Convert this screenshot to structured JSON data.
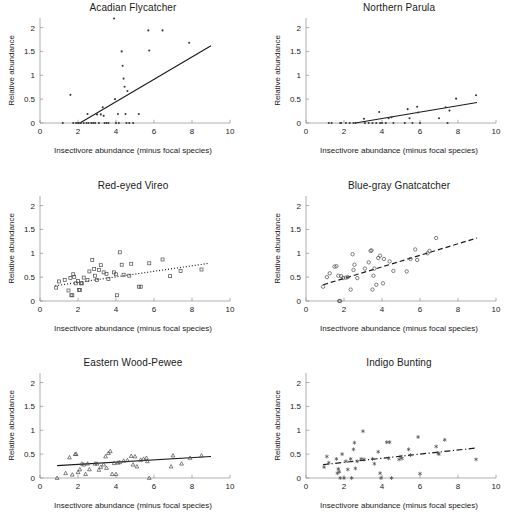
{
  "figure": {
    "width": 532,
    "height": 532,
    "background": "#ffffff",
    "layout": "2 columns x 3 rows of scatter panels",
    "shared_xlabel": "Insectivore abundance (minus focal species)",
    "shared_ylabel": "Relative abundance",
    "xticks": [
      0,
      2,
      4,
      6,
      8,
      10
    ],
    "yticks": [
      0,
      0.5,
      1,
      1.5,
      2
    ],
    "xlim": [
      0,
      10
    ],
    "ylim": [
      0,
      2.2
    ],
    "axis_color": "#8c8c8c",
    "text_color": "#1a1a1a",
    "marker_color": "#3a3a3a",
    "line_color": "#1a1a1a"
  },
  "chart_data": [
    {
      "type": "scatter",
      "title": "Acadian Flycatcher",
      "xlabel": "Insectivore abundance (minus focal species)",
      "ylabel": "Relative abundance",
      "xlim": [
        0,
        10
      ],
      "ylim": [
        0,
        2.2
      ],
      "xticks": [
        0,
        2,
        4,
        6,
        8,
        10
      ],
      "yticks": [
        0,
        0.5,
        1,
        1.5,
        2
      ],
      "grid": false,
      "legend": "none",
      "marker": "point",
      "linestyle": "solid",
      "fit_line": {
        "x": [
          2.1,
          9.0
        ],
        "y": [
          0.0,
          1.62
        ]
      },
      "points": [
        [
          1.2,
          0.0
        ],
        [
          1.6,
          0.59
        ],
        [
          1.75,
          0.0
        ],
        [
          1.9,
          0.0
        ],
        [
          2.0,
          0.0
        ],
        [
          2.05,
          0.0
        ],
        [
          2.15,
          0.0
        ],
        [
          2.3,
          0.0
        ],
        [
          2.45,
          0.0
        ],
        [
          2.5,
          0.19
        ],
        [
          2.55,
          0.0
        ],
        [
          2.7,
          0.0
        ],
        [
          2.8,
          0.0
        ],
        [
          2.9,
          0.0
        ],
        [
          3.0,
          0.18
        ],
        [
          3.1,
          0.0
        ],
        [
          3.2,
          0.18
        ],
        [
          3.3,
          0.33
        ],
        [
          3.35,
          0.15
        ],
        [
          3.4,
          0.0
        ],
        [
          3.5,
          0.0
        ],
        [
          3.6,
          0.0
        ],
        [
          3.9,
          2.19
        ],
        [
          3.95,
          0.5
        ],
        [
          4.0,
          0.0
        ],
        [
          4.1,
          0.19
        ],
        [
          4.15,
          0.0
        ],
        [
          4.3,
          1.5
        ],
        [
          4.35,
          1.2
        ],
        [
          4.4,
          0.93
        ],
        [
          4.45,
          0.76
        ],
        [
          4.5,
          0.19
        ],
        [
          4.55,
          0.0
        ],
        [
          4.6,
          0.67
        ],
        [
          4.7,
          0.0
        ],
        [
          4.9,
          0.0
        ],
        [
          5.2,
          0.19
        ],
        [
          5.7,
          1.94
        ],
        [
          5.75,
          1.52
        ],
        [
          6.45,
          1.94
        ],
        [
          7.85,
          1.68
        ]
      ]
    },
    {
      "type": "scatter",
      "title": "Northern Parula",
      "xlabel": "Insectivore abundance (minus focal species)",
      "ylabel": "Relative abundance",
      "xlim": [
        0,
        10
      ],
      "ylim": [
        0,
        2.2
      ],
      "xticks": [
        0,
        2,
        4,
        6,
        8,
        10
      ],
      "yticks": [
        0,
        0.5,
        1,
        1.5,
        2
      ],
      "grid": false,
      "legend": "none",
      "marker": "point",
      "linestyle": "solid",
      "fit_line": {
        "x": [
          2.6,
          9.0
        ],
        "y": [
          0.0,
          0.43
        ]
      },
      "points": [
        [
          1.2,
          0.0
        ],
        [
          1.35,
          0.0
        ],
        [
          1.8,
          0.0
        ],
        [
          1.85,
          0.0
        ],
        [
          2.1,
          0.0
        ],
        [
          2.3,
          0.0
        ],
        [
          2.5,
          0.0
        ],
        [
          2.6,
          0.0
        ],
        [
          3.05,
          0.09
        ],
        [
          3.1,
          0.0
        ],
        [
          3.3,
          0.0
        ],
        [
          3.5,
          0.0
        ],
        [
          3.7,
          0.0
        ],
        [
          3.85,
          0.23
        ],
        [
          3.9,
          0.0
        ],
        [
          4.0,
          0.0
        ],
        [
          4.2,
          0.0
        ],
        [
          4.35,
          0.1
        ],
        [
          4.5,
          0.12
        ],
        [
          4.6,
          0.0
        ],
        [
          5.2,
          0.0
        ],
        [
          5.35,
          0.29
        ],
        [
          5.45,
          0.1
        ],
        [
          5.6,
          0.0
        ],
        [
          5.85,
          0.34
        ],
        [
          5.9,
          0.22
        ],
        [
          6.0,
          0.0
        ],
        [
          7.0,
          0.1
        ],
        [
          7.35,
          0.33
        ],
        [
          7.45,
          0.0
        ],
        [
          7.55,
          0.26
        ],
        [
          7.9,
          0.51
        ],
        [
          8.95,
          0.58
        ]
      ]
    },
    {
      "type": "scatter",
      "title": "Red-eyed Vireo",
      "xlabel": "Insectivore abundance (minus focal species)",
      "ylabel": "Relative abundance",
      "xlim": [
        0,
        10
      ],
      "ylim": [
        0,
        2.2
      ],
      "xticks": [
        0,
        2,
        4,
        6,
        8,
        10
      ],
      "yticks": [
        0,
        0.5,
        1,
        1.5,
        2
      ],
      "grid": false,
      "legend": "none",
      "marker": "square-open",
      "linestyle": "dotted",
      "fit_line": {
        "x": [
          0.8,
          8.9
        ],
        "y": [
          0.32,
          0.79
        ]
      },
      "points": [
        [
          0.85,
          0.28
        ],
        [
          1.0,
          0.41
        ],
        [
          1.3,
          0.44
        ],
        [
          1.5,
          0.22
        ],
        [
          1.6,
          0.48
        ],
        [
          1.65,
          0.12
        ],
        [
          1.7,
          0.12
        ],
        [
          1.75,
          0.56
        ],
        [
          1.8,
          0.5
        ],
        [
          1.9,
          0.37
        ],
        [
          2.0,
          0.42
        ],
        [
          2.05,
          0.23
        ],
        [
          2.1,
          0.23
        ],
        [
          2.15,
          0.37
        ],
        [
          2.2,
          0.37
        ],
        [
          2.3,
          0.49
        ],
        [
          2.5,
          0.44
        ],
        [
          2.6,
          0.62
        ],
        [
          2.75,
          0.86
        ],
        [
          2.85,
          0.67
        ],
        [
          2.9,
          0.53
        ],
        [
          3.0,
          0.44
        ],
        [
          3.1,
          0.65
        ],
        [
          3.2,
          0.75
        ],
        [
          3.35,
          0.6
        ],
        [
          3.5,
          0.57
        ],
        [
          3.6,
          0.46
        ],
        [
          3.9,
          0.6
        ],
        [
          4.0,
          0.56
        ],
        [
          4.05,
          0.12
        ],
        [
          4.2,
          1.02
        ],
        [
          4.3,
          0.76
        ],
        [
          4.4,
          0.55
        ],
        [
          4.7,
          0.53
        ],
        [
          4.8,
          0.78
        ],
        [
          5.2,
          0.3
        ],
        [
          5.3,
          0.3
        ],
        [
          5.75,
          0.79
        ],
        [
          6.45,
          0.87
        ],
        [
          6.85,
          0.52
        ],
        [
          7.4,
          0.63
        ],
        [
          8.5,
          0.66
        ]
      ]
    },
    {
      "type": "scatter",
      "title": "Blue-gray Gnatcatcher",
      "xlabel": "Insectivore abundance (minus focal species)",
      "ylabel": "Relative abundance",
      "xlim": [
        0,
        10
      ],
      "ylim": [
        0,
        2.2
      ],
      "xticks": [
        0,
        2,
        4,
        6,
        8,
        10
      ],
      "yticks": [
        0,
        0.5,
        1,
        1.5,
        2
      ],
      "grid": false,
      "legend": "none",
      "marker": "circle-open",
      "linestyle": "dashed",
      "fit_line": {
        "x": [
          0.9,
          9.0
        ],
        "y": [
          0.34,
          1.32
        ]
      },
      "points": [
        [
          0.9,
          0.3
        ],
        [
          1.1,
          0.5
        ],
        [
          1.25,
          0.58
        ],
        [
          1.5,
          0.72
        ],
        [
          1.6,
          0.73
        ],
        [
          1.7,
          0.53
        ],
        [
          1.75,
          0.0
        ],
        [
          1.8,
          0.0
        ],
        [
          1.85,
          0.52
        ],
        [
          1.95,
          0.48
        ],
        [
          2.1,
          0.49
        ],
        [
          2.2,
          0.5
        ],
        [
          2.35,
          0.24
        ],
        [
          2.45,
          0.98
        ],
        [
          2.5,
          0.65
        ],
        [
          2.55,
          0.76
        ],
        [
          2.7,
          0.48
        ],
        [
          3.1,
          0.68
        ],
        [
          3.3,
          0.81
        ],
        [
          3.4,
          1.05
        ],
        [
          3.45,
          1.06
        ],
        [
          3.5,
          0.24
        ],
        [
          3.55,
          0.53
        ],
        [
          3.6,
          0.68
        ],
        [
          3.7,
          0.34
        ],
        [
          3.8,
          0.9
        ],
        [
          3.9,
          0.95
        ],
        [
          4.05,
          0.37
        ],
        [
          4.1,
          0.88
        ],
        [
          4.4,
          0.83
        ],
        [
          4.6,
          0.63
        ],
        [
          5.3,
          0.62
        ],
        [
          5.5,
          0.88
        ],
        [
          5.75,
          1.08
        ],
        [
          5.85,
          0.86
        ],
        [
          6.4,
          1.0
        ],
        [
          6.5,
          1.05
        ],
        [
          6.85,
          1.32
        ]
      ]
    },
    {
      "type": "scatter",
      "title": "Eastern Wood-Pewee",
      "xlabel": "Insectivore abundance (minus focal species)",
      "ylabel": "Relative abundance",
      "xlim": [
        0,
        10
      ],
      "ylim": [
        0,
        2.2
      ],
      "xticks": [
        0,
        2,
        4,
        6,
        8,
        10
      ],
      "yticks": [
        0,
        0.5,
        1,
        1.5,
        2
      ],
      "grid": false,
      "legend": "none",
      "marker": "triangle-open",
      "linestyle": "solid",
      "fit_line": {
        "x": [
          0.9,
          9.0
        ],
        "y": [
          0.26,
          0.45
        ]
      },
      "points": [
        [
          0.9,
          0.0
        ],
        [
          1.35,
          0.1
        ],
        [
          1.55,
          0.43
        ],
        [
          1.7,
          0.07
        ],
        [
          1.85,
          0.5
        ],
        [
          1.9,
          0.5
        ],
        [
          2.0,
          0.12
        ],
        [
          2.1,
          0.18
        ],
        [
          2.2,
          0.3
        ],
        [
          2.3,
          0.28
        ],
        [
          2.4,
          0.08
        ],
        [
          2.5,
          0.3
        ],
        [
          2.6,
          0.18
        ],
        [
          2.9,
          0.3
        ],
        [
          3.0,
          0.3
        ],
        [
          3.1,
          0.17
        ],
        [
          3.2,
          0.23
        ],
        [
          3.35,
          0.28
        ],
        [
          3.45,
          0.45
        ],
        [
          3.5,
          0.21
        ],
        [
          3.6,
          0.52
        ],
        [
          3.7,
          0.56
        ],
        [
          3.8,
          0.08
        ],
        [
          3.9,
          0.31
        ],
        [
          4.0,
          0.08
        ],
        [
          4.1,
          0.32
        ],
        [
          4.2,
          0.33
        ],
        [
          4.4,
          0.36
        ],
        [
          4.6,
          0.37
        ],
        [
          4.8,
          0.46
        ],
        [
          4.9,
          0.28
        ],
        [
          5.0,
          0.45
        ],
        [
          5.1,
          0.24
        ],
        [
          5.3,
          0.38
        ],
        [
          5.45,
          0.4
        ],
        [
          5.6,
          0.42
        ],
        [
          5.65,
          0.35
        ],
        [
          5.75,
          0.0
        ],
        [
          6.9,
          0.24
        ],
        [
          7.0,
          0.47
        ],
        [
          7.45,
          0.3
        ],
        [
          7.9,
          0.42
        ],
        [
          8.5,
          0.47
        ]
      ]
    },
    {
      "type": "scatter",
      "title": "Indigo Bunting",
      "xlabel": "Insectivore abundance (minus focal species)",
      "ylabel": "Relative abundance",
      "xlim": [
        0,
        10
      ],
      "ylim": [
        0,
        2.2
      ],
      "xticks": [
        0,
        2,
        4,
        6,
        8,
        10
      ],
      "yticks": [
        0,
        0.5,
        1,
        1.5,
        2
      ],
      "grid": false,
      "legend": "none",
      "marker": "star",
      "linestyle": "dash-dot",
      "fit_line": {
        "x": [
          0.9,
          9.0
        ],
        "y": [
          0.28,
          0.63
        ]
      },
      "points": [
        [
          0.95,
          0.23
        ],
        [
          1.1,
          0.45
        ],
        [
          1.2,
          0.32
        ],
        [
          1.6,
          0.4
        ],
        [
          1.65,
          0.1
        ],
        [
          1.7,
          0.19
        ],
        [
          1.75,
          0.13
        ],
        [
          1.8,
          0.0
        ],
        [
          1.9,
          0.5
        ],
        [
          2.0,
          0.0
        ],
        [
          2.1,
          0.35
        ],
        [
          2.2,
          0.18
        ],
        [
          2.35,
          0.4
        ],
        [
          2.4,
          0.0
        ],
        [
          2.5,
          0.6
        ],
        [
          2.55,
          0.74
        ],
        [
          2.6,
          0.2
        ],
        [
          2.7,
          0.35
        ],
        [
          2.9,
          0.4
        ],
        [
          3.0,
          0.98
        ],
        [
          3.05,
          0.39
        ],
        [
          3.5,
          0.4
        ],
        [
          3.6,
          0.3
        ],
        [
          3.8,
          0.55
        ],
        [
          3.9,
          0.1
        ],
        [
          3.95,
          0.0
        ],
        [
          4.25,
          0.75
        ],
        [
          4.35,
          0.41
        ],
        [
          4.4,
          0.75
        ],
        [
          4.5,
          0.0
        ],
        [
          4.9,
          0.39
        ],
        [
          5.0,
          0.45
        ],
        [
          5.05,
          0.41
        ],
        [
          5.4,
          0.6
        ],
        [
          5.5,
          0.48
        ],
        [
          5.9,
          0.86
        ],
        [
          6.0,
          0.09
        ],
        [
          6.85,
          0.66
        ],
        [
          6.95,
          0.52
        ],
        [
          7.0,
          0.5
        ],
        [
          7.3,
          0.8
        ],
        [
          8.95,
          0.39
        ]
      ]
    }
  ]
}
